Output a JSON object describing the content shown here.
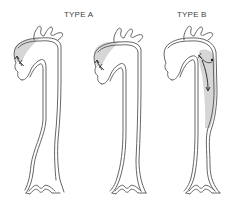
{
  "diagram": {
    "labels": {
      "type_a": "TYPE A",
      "type_b": "TYPE B"
    },
    "panels": [
      {
        "id": "aorta-1",
        "group": "TYPE A",
        "description": "Dissection of ascending aorta only"
      },
      {
        "id": "aorta-2",
        "group": "TYPE A",
        "description": "Dissection of ascending aorta and arch"
      },
      {
        "id": "aorta-3",
        "group": "TYPE B",
        "description": "Dissection of descending aorta distal to left subclavian"
      }
    ],
    "colors": {
      "outline": "#555555",
      "false_lumen": "#d6d6d6",
      "background": "#ffffff"
    }
  }
}
